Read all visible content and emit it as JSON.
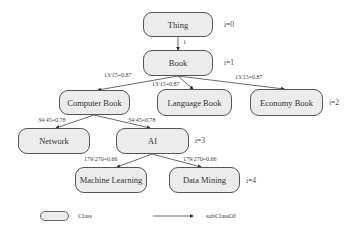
{
  "nodes": {
    "thing": {
      "label": "Thing"
    },
    "book": {
      "label": "Book"
    },
    "computer_book": {
      "label": "Computer Book"
    },
    "language_book": {
      "label": "Language Book"
    },
    "economy_book": {
      "label": "Economy Book"
    },
    "network": {
      "label": "Network"
    },
    "ai": {
      "label": "AI"
    },
    "machine_learning": {
      "label": "Machine Learning"
    },
    "data_mining": {
      "label": "Data Mining"
    }
  },
  "levels": [
    "i=0",
    "i=1",
    "i=2",
    "i=3",
    "i=4"
  ],
  "edges": {
    "thing_book": "1",
    "book_computer": "13/15=0.87",
    "book_language": "13/15=0.87",
    "book_economy": "13/15=0.87",
    "computer_network": "34/45=0.78",
    "computer_ai": "34/45=0.78",
    "ai_ml": "179/270=0.66",
    "ai_dm": "179/270=0.66"
  },
  "legend": {
    "class_label": "Class",
    "edge_label": "subClassOf"
  }
}
